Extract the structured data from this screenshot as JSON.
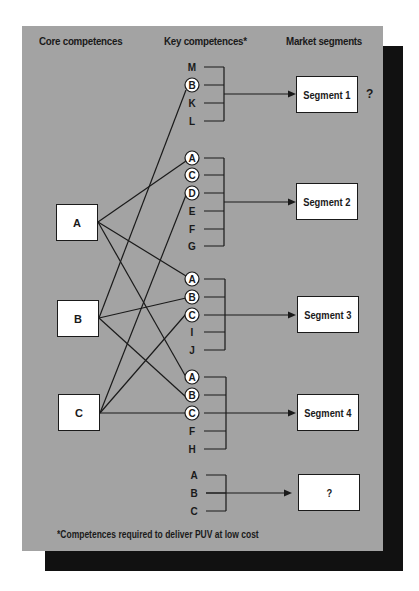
{
  "headers": {
    "core": "Core competences",
    "key": "Key competences*",
    "market": "Market segments"
  },
  "core_competences": [
    {
      "id": "A",
      "label": "A"
    },
    {
      "id": "B",
      "label": "B"
    },
    {
      "id": "C",
      "label": "C"
    }
  ],
  "clusters": [
    {
      "segment": "Segment 1",
      "suffix": "?",
      "items": [
        {
          "label": "M",
          "circled": false
        },
        {
          "label": "B",
          "circled": true
        },
        {
          "label": "K",
          "circled": false
        },
        {
          "label": "L",
          "circled": false
        }
      ]
    },
    {
      "segment": "Segment 2",
      "items": [
        {
          "label": "A",
          "circled": true
        },
        {
          "label": "C",
          "circled": true
        },
        {
          "label": "D",
          "circled": true
        },
        {
          "label": "E",
          "circled": false
        },
        {
          "label": "F",
          "circled": false
        },
        {
          "label": "G",
          "circled": false
        }
      ]
    },
    {
      "segment": "Segment 3",
      "items": [
        {
          "label": "A",
          "circled": true
        },
        {
          "label": "B",
          "circled": true
        },
        {
          "label": "C",
          "circled": true
        },
        {
          "label": "I",
          "circled": false
        },
        {
          "label": "J",
          "circled": false
        }
      ]
    },
    {
      "segment": "Segment 4",
      "items": [
        {
          "label": "A",
          "circled": true
        },
        {
          "label": "B",
          "circled": true
        },
        {
          "label": "C",
          "circled": true
        },
        {
          "label": "F",
          "circled": false
        },
        {
          "label": "H",
          "circled": false
        }
      ]
    },
    {
      "segment": "?",
      "items": [
        {
          "label": "A",
          "circled": false
        },
        {
          "label": "B",
          "circled": false
        },
        {
          "label": "C",
          "circled": false
        }
      ]
    }
  ],
  "links": [
    {
      "from": "A",
      "to": "Segment 2 / A"
    },
    {
      "from": "A",
      "to": "Segment 3 / A"
    },
    {
      "from": "A",
      "to": "Segment 4 / A"
    },
    {
      "from": "B",
      "to": "Segment 1 / B"
    },
    {
      "from": "B",
      "to": "Segment 3 / B"
    },
    {
      "from": "B",
      "to": "Segment 4 / B"
    },
    {
      "from": "C",
      "to": "Segment 2 / D"
    },
    {
      "from": "C",
      "to": "Segment 3 / C"
    },
    {
      "from": "C",
      "to": "Segment 4 / C"
    }
  ],
  "footnote": "*Competences required to deliver PUV at low cost",
  "colors": {
    "panel": "#a3a3a3",
    "shadow": "#111111",
    "ink": "#1a1a1a",
    "box": "#ffffff"
  }
}
